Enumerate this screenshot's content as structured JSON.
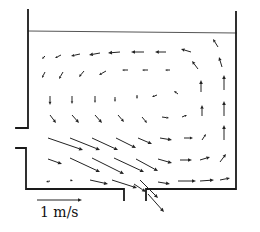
{
  "figure": {
    "type": "velocity vector field in a tank",
    "scale_arrow": {
      "label": "1 m/s",
      "x1": 37,
      "y1": 200,
      "x2": 82,
      "y2": 200
    },
    "colors": {
      "wall": "#1a1a1a",
      "free_surface": "#555555",
      "arrow": "#222222"
    }
  },
  "geometry": {
    "free_surface": [
      [
        28,
        31
      ],
      [
        237,
        33
      ]
    ],
    "walls": [
      [
        [
          28,
          10
        ],
        [
          28,
          128
        ],
        [
          16,
          128
        ]
      ],
      [
        [
          16,
          148
        ],
        [
          26,
          148
        ],
        [
          26,
          189
        ],
        [
          124,
          189
        ],
        [
          124,
          200
        ]
      ],
      [
        [
          146,
          200
        ],
        [
          146,
          189
        ],
        [
          236,
          189
        ],
        [
          236,
          12
        ]
      ]
    ]
  },
  "vectors": [
    [
      45,
      56,
      -3,
      3
    ],
    [
      61,
      55,
      -6,
      3
    ],
    [
      80,
      54,
      -9,
      2
    ],
    [
      100,
      53,
      -11,
      2
    ],
    [
      120,
      52,
      -12,
      1
    ],
    [
      144,
      52,
      -13,
      0
    ],
    [
      166,
      52,
      -11,
      0
    ],
    [
      191,
      52,
      -10,
      -3
    ],
    [
      218,
      47,
      -5,
      -8
    ],
    [
      45,
      72,
      -3,
      6
    ],
    [
      63,
      72,
      -4,
      7
    ],
    [
      84,
      71,
      -5,
      6
    ],
    [
      106,
      71,
      -7,
      4
    ],
    [
      128,
      70,
      -6,
      0
    ],
    [
      148,
      70,
      -6,
      0
    ],
    [
      170,
      70,
      -5,
      0
    ],
    [
      198,
      69,
      -6,
      -8
    ],
    [
      222,
      67,
      -3,
      -10
    ],
    [
      50,
      96,
      0,
      9
    ],
    [
      72,
      96,
      0,
      8
    ],
    [
      95,
      96,
      0,
      7
    ],
    [
      115,
      97,
      0,
      5
    ],
    [
      137,
      95,
      0,
      4
    ],
    [
      157,
      95,
      -5,
      2
    ],
    [
      178,
      94,
      -4,
      -3
    ],
    [
      201,
      92,
      0,
      -12
    ],
    [
      224,
      90,
      0,
      -15
    ],
    [
      50,
      115,
      6,
      8
    ],
    [
      72,
      115,
      7,
      8
    ],
    [
      95,
      115,
      7,
      8
    ],
    [
      118,
      115,
      6,
      7
    ],
    [
      142,
      117,
      5,
      6
    ],
    [
      162,
      117,
      7,
      1
    ],
    [
      182,
      117,
      5,
      -2
    ],
    [
      202,
      116,
      0,
      -11
    ],
    [
      224,
      116,
      0,
      -15
    ],
    [
      48,
      138,
      35,
      12
    ],
    [
      70,
      138,
      30,
      12
    ],
    [
      92,
      138,
      26,
      12
    ],
    [
      116,
      138,
      20,
      10
    ],
    [
      138,
      138,
      14,
      6
    ],
    [
      160,
      138,
      12,
      2
    ],
    [
      184,
      138,
      9,
      0
    ],
    [
      202,
      140,
      4,
      -6
    ],
    [
      224,
      140,
      0,
      -15
    ],
    [
      48,
      159,
      14,
      5
    ],
    [
      70,
      158,
      30,
      14
    ],
    [
      92,
      158,
      32,
      16
    ],
    [
      114,
      158,
      30,
      14
    ],
    [
      136,
      159,
      22,
      12
    ],
    [
      158,
      159,
      14,
      4
    ],
    [
      180,
      160,
      12,
      0
    ],
    [
      200,
      160,
      10,
      -3
    ],
    [
      220,
      162,
      6,
      -8
    ],
    [
      50,
      181,
      -4,
      1
    ],
    [
      70,
      180,
      3,
      1
    ],
    [
      90,
      180,
      18,
      4
    ],
    [
      112,
      180,
      25,
      8
    ],
    [
      140,
      180,
      18,
      18
    ],
    [
      158,
      182,
      12,
      2
    ],
    [
      178,
      181,
      18,
      0
    ],
    [
      200,
      181,
      14,
      -1
    ],
    [
      220,
      180,
      10,
      -2
    ],
    [
      134,
      184,
      12,
      8
    ],
    [
      148,
      194,
      16,
      18
    ]
  ]
}
